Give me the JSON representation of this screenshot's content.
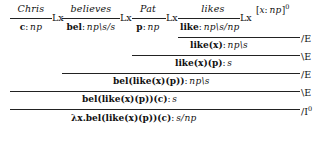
{
  "figure": {
    "kind": "natural-deduction-proof-tree",
    "formalism": "Lambek categorial grammar",
    "sentence": "Chris believes Pat likes",
    "ink_color": "#111111",
    "rule_line_color": "#222222"
  },
  "lexical_entries": [
    {
      "word": "Chris",
      "rule": "Lx",
      "term": "c",
      "colon": ":",
      "type": "np"
    },
    {
      "word": "believes",
      "rule": "Lx",
      "term": "bel",
      "colon": ":",
      "type": "np\\s/s"
    },
    {
      "word": "Pat",
      "rule": "Lx",
      "term": "p",
      "colon": ":",
      "type": "np"
    },
    {
      "word": "likes",
      "rule": "Lx",
      "term": "like",
      "colon": ":",
      "type": "np\\s/np"
    }
  ],
  "hypothesis": {
    "open_bracket": "[",
    "variable": "x",
    "colon": ":",
    "type": "np",
    "close_bracket": "]",
    "discharge_label": "0"
  },
  "steps": [
    {
      "id": "step-1",
      "rule": "/E",
      "rule_slash": "/",
      "rule_letter": "E",
      "term": "like(x)",
      "colon": ":",
      "type": "np\\s"
    },
    {
      "id": "step-2",
      "rule": "\\E",
      "rule_slash": "\\",
      "rule_letter": "E",
      "term": "like(x)(p)",
      "colon": ":",
      "type": "s"
    },
    {
      "id": "step-3",
      "rule": "/E",
      "rule_slash": "/",
      "rule_letter": "E",
      "term": "bel(like(x)(p))",
      "colon": ":",
      "type": "np\\s"
    },
    {
      "id": "step-4",
      "rule": "\\E",
      "rule_slash": "\\",
      "rule_letter": "E",
      "term": "bel(like(x)(p))(c)",
      "colon": ":",
      "type": "s"
    },
    {
      "id": "step-5",
      "rule": "/I",
      "rule_slash": "/",
      "rule_letter": "I",
      "rule_superscript": "0",
      "term": "λx.bel(like(x)(p))(c)",
      "colon": ":",
      "type": "s/np"
    }
  ]
}
